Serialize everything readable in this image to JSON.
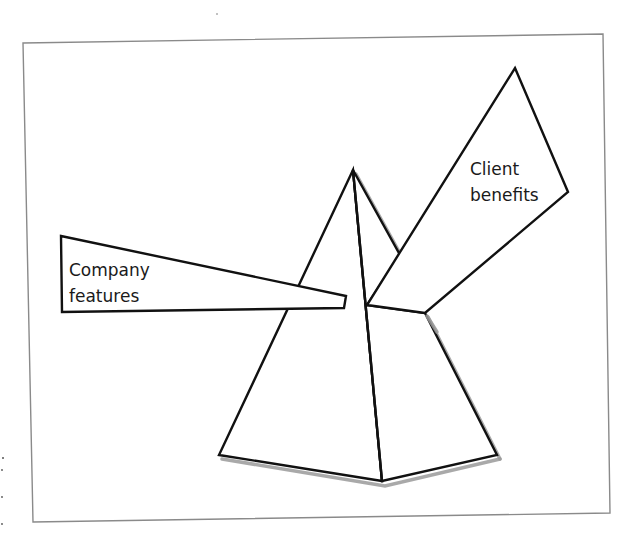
{
  "diagram": {
    "title": "",
    "colors": {
      "outline": "#111111",
      "frame": "#8a8a8a",
      "shadow": "#9a9a9a",
      "fill": "#ffffff",
      "text": "#1a1a1a"
    },
    "labels": {
      "input_line1": "Company",
      "input_line2": "features",
      "output_line1": "Client",
      "output_line2": "benefits"
    },
    "nodes": [
      {
        "id": "company-features",
        "label": "Company features",
        "shape": "incoming-beam"
      },
      {
        "id": "prism",
        "label": "",
        "shape": "pyramid"
      },
      {
        "id": "client-benefits",
        "label": "Client benefits",
        "shape": "outgoing-beam"
      }
    ],
    "edges": [
      {
        "from": "company-features",
        "to": "prism"
      },
      {
        "from": "prism",
        "to": "client-benefits"
      }
    ]
  }
}
